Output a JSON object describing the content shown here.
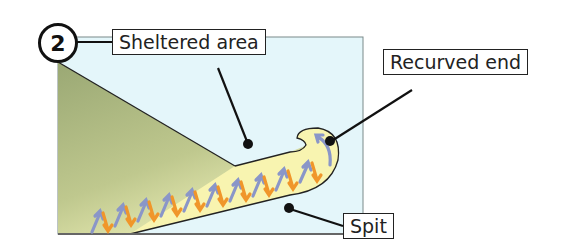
{
  "figure": {
    "step_number": "2",
    "labels": {
      "sheltered_area": "Sheltered area",
      "recurved_end": "Recurved end",
      "spit": "Spit"
    },
    "colors": {
      "sea": "#e4f6fa",
      "land": "#a9b57e",
      "spit_fill": "#f8f4b0",
      "swash_arrow": "#8a96c8",
      "backwash_arrow": "#f0962a",
      "outline": "#222222"
    }
  }
}
